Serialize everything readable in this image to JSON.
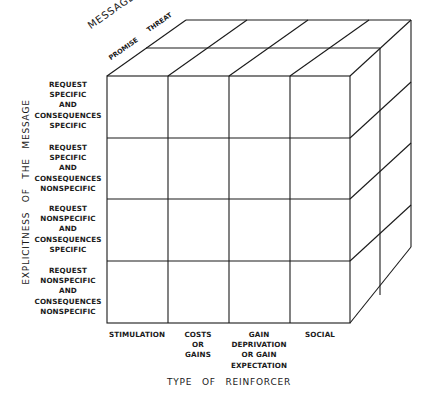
{
  "diagram": {
    "type": "3d-cube-classification",
    "axes": {
      "vertical": "EXPLICITNESS OF THE MESSAGE",
      "horizontal": "TYPE OF REINFORCER",
      "depth": "MESSAGE TYPE"
    },
    "depth_levels": [
      "PROMISE",
      "THREAT"
    ],
    "rows": [
      {
        "lines": [
          "REQUEST",
          "SPECIFIC",
          "AND",
          "CONSEQUENCES",
          "SPECIFIC"
        ]
      },
      {
        "lines": [
          "REQUEST",
          "SPECIFIC",
          "AND",
          "CONSEQUENCES",
          "NONSPECIFIC"
        ]
      },
      {
        "lines": [
          "REQUEST",
          "NONSPECIFIC",
          "AND",
          "CONSEQUENCES",
          "SPECIFIC"
        ]
      },
      {
        "lines": [
          "REQUEST",
          "NONSPECIFIC",
          "AND",
          "CONSEQUENCES",
          "NONSPECIFIC"
        ]
      }
    ],
    "columns": [
      {
        "lines": [
          "STIMULATION"
        ]
      },
      {
        "lines": [
          "COSTS",
          "OR",
          "GAINS"
        ]
      },
      {
        "lines": [
          "GAIN",
          "DEPRIVATION",
          "OR GAIN",
          "EXPECTATION"
        ]
      },
      {
        "lines": [
          "SOCIAL"
        ]
      }
    ],
    "line_color": "#1a1a1a",
    "background": "#ffffff"
  }
}
